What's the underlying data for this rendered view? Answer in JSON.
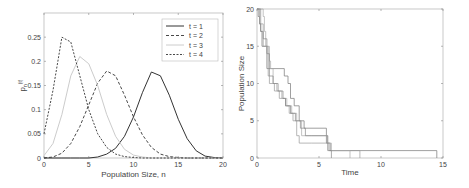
{
  "chart_data": [
    {
      "type": "line",
      "title": "",
      "xlabel": "Population Size, n",
      "ylabel": "p_n(t)",
      "xlim": [
        0,
        20
      ],
      "ylim": [
        0,
        0.3
      ],
      "xticks": [
        "0",
        "5",
        "10",
        "15",
        "20"
      ],
      "yticks": [
        "0",
        "0.05",
        "0.1",
        "0.15",
        "0.2",
        "0.25"
      ],
      "grid": false,
      "legend_position": "upper right",
      "x": [
        0,
        1,
        2,
        3,
        4,
        5,
        6,
        7,
        8,
        9,
        10,
        11,
        12,
        13,
        14,
        15,
        16,
        17,
        18,
        19,
        20
      ],
      "series": [
        {
          "name": "t = 1",
          "style": "solid dark",
          "values": [
            0,
            0,
            0,
            0,
            0,
            0,
            0.002,
            0.008,
            0.02,
            0.045,
            0.085,
            0.135,
            0.178,
            0.17,
            0.13,
            0.08,
            0.04,
            0.015,
            0.004,
            0.001,
            0
          ]
        },
        {
          "name": "t = 2",
          "style": "dashed",
          "values": [
            0,
            0.002,
            0.01,
            0.03,
            0.065,
            0.11,
            0.155,
            0.18,
            0.17,
            0.13,
            0.085,
            0.048,
            0.022,
            0.008,
            0.003,
            0.001,
            0,
            0,
            0,
            0,
            0
          ]
        },
        {
          "name": "t = 3",
          "style": "solid light",
          "values": [
            0.005,
            0.03,
            0.09,
            0.17,
            0.21,
            0.195,
            0.15,
            0.09,
            0.045,
            0.018,
            0.006,
            0.002,
            0,
            0,
            0,
            0,
            0,
            0,
            0,
            0,
            0
          ]
        },
        {
          "name": "t = 4",
          "style": "dash-dot",
          "values": [
            0.05,
            0.14,
            0.25,
            0.24,
            0.17,
            0.1,
            0.05,
            0.022,
            0.008,
            0.003,
            0.001,
            0,
            0,
            0,
            0,
            0,
            0,
            0,
            0,
            0,
            0
          ]
        }
      ]
    },
    {
      "type": "line",
      "title": "",
      "xlabel": "Time",
      "ylabel": "Population Size",
      "xlim": [
        0,
        15
      ],
      "ylim": [
        0,
        20
      ],
      "xticks": [
        "0",
        "5",
        "10",
        "15"
      ],
      "yticks": [
        "0",
        "5",
        "10",
        "15",
        "20"
      ],
      "grid": false,
      "step": true,
      "series": [
        {
          "name": "run 1",
          "points": [
            [
              0,
              20
            ],
            [
              0.1,
              19
            ],
            [
              0.2,
              18
            ],
            [
              0.3,
              17
            ],
            [
              0.4,
              15
            ],
            [
              0.8,
              12
            ],
            [
              2.1,
              12
            ],
            [
              2.2,
              11
            ],
            [
              2.5,
              10
            ],
            [
              2.7,
              8
            ],
            [
              3.0,
              7
            ],
            [
              3.4,
              5
            ],
            [
              3.8,
              4
            ],
            [
              5.4,
              4
            ],
            [
              5.6,
              2
            ],
            [
              5.9,
              1
            ],
            [
              14.5,
              1
            ],
            [
              14.5,
              0
            ]
          ]
        },
        {
          "name": "run 2",
          "points": [
            [
              0,
              20
            ],
            [
              0.2,
              18
            ],
            [
              0.5,
              15
            ],
            [
              0.9,
              11
            ],
            [
              1.0,
              10
            ],
            [
              1.4,
              9
            ],
            [
              1.8,
              8
            ],
            [
              2.3,
              7
            ],
            [
              2.6,
              6
            ],
            [
              2.9,
              5
            ],
            [
              3.2,
              3
            ],
            [
              3.4,
              2
            ],
            [
              4.4,
              2
            ],
            [
              5.5,
              2
            ],
            [
              5.8,
              1
            ],
            [
              8.3,
              1
            ],
            [
              8.3,
              0
            ]
          ]
        },
        {
          "name": "run 3",
          "points": [
            [
              0,
              20
            ],
            [
              0.5,
              19
            ],
            [
              0.6,
              17
            ],
            [
              0.7,
              15
            ],
            [
              1.0,
              13
            ],
            [
              1.1,
              12
            ],
            [
              1.3,
              10
            ],
            [
              1.6,
              9
            ],
            [
              2.0,
              8
            ],
            [
              2.4,
              7
            ],
            [
              2.8,
              6
            ],
            [
              3.2,
              5
            ],
            [
              3.6,
              3
            ],
            [
              4.4,
              3
            ],
            [
              5.7,
              2
            ],
            [
              6.0,
              1
            ],
            [
              7.5,
              1
            ],
            [
              7.5,
              0
            ]
          ]
        },
        {
          "name": "run 4",
          "points": [
            [
              0,
              20
            ],
            [
              0.3,
              17
            ],
            [
              0.5,
              16
            ],
            [
              0.8,
              14
            ],
            [
              1.0,
              11
            ],
            [
              1.3,
              10
            ],
            [
              1.7,
              9
            ],
            [
              2.1,
              8
            ],
            [
              2.3,
              7
            ],
            [
              2.7,
              6
            ],
            [
              3.1,
              5
            ],
            [
              3.5,
              4
            ],
            [
              3.9,
              3
            ],
            [
              5.7,
              1
            ],
            [
              6.0,
              1
            ],
            [
              6.0,
              0
            ]
          ]
        }
      ]
    }
  ],
  "labels": {
    "left_xlabel": "Population Size, n",
    "left_ylabel": "p",
    "left_ylabel_sub": "n",
    "left_ylabel_sup": "(t)",
    "right_xlabel": "Time",
    "right_ylabel": "Population Size",
    "legend": [
      "t = 1",
      "t = 2",
      "t = 3",
      "t = 4"
    ]
  }
}
